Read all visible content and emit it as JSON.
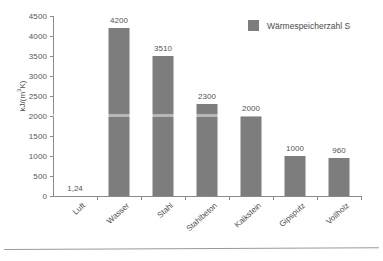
{
  "chart_data": {
    "type": "bar",
    "title": "",
    "subtitle": "",
    "xlabel": "",
    "ylabel": "kJ/(m³K)",
    "ylim": [
      0,
      4500
    ],
    "ytick_step": 500,
    "grid": false,
    "legend_position": "top-right",
    "categories": [
      "Luft",
      "Wasser",
      "Stahl",
      "Stahlbeton",
      "Kalkstein",
      "Gipsputz",
      "Vollholz"
    ],
    "values": [
      1.24,
      4200,
      3510,
      2300,
      2000,
      1000,
      960
    ],
    "value_labels": [
      "1,24",
      "4200",
      "3510",
      "2300",
      "2000",
      "1000",
      "960"
    ],
    "ytick_labels": [
      "0",
      "500",
      "1000",
      "1500",
      "2000",
      "2500",
      "3000",
      "3500",
      "4000",
      "4500"
    ],
    "ytick_values": [
      0,
      500,
      1000,
      1500,
      2000,
      2500,
      3000,
      3500,
      4000,
      4500
    ],
    "series": [
      {
        "name": "Wärmespeicherzahl S",
        "color": "#7d7d7d",
        "values": [
          1.24,
          4200,
          3510,
          2300,
          2000,
          1000,
          960
        ]
      }
    ],
    "legend": [
      {
        "label": "Wärmespeicherzahl S",
        "color": "#7d7d7d"
      }
    ]
  },
  "axis": {
    "y_title_main": "kJ/(m",
    "y_title_sup": "3",
    "y_title_tail": "K)"
  },
  "colors": {
    "bar": "#7d7d7d",
    "axis": "#8b8b8b",
    "text": "#4f4f4f",
    "background": "#ffffff"
  }
}
